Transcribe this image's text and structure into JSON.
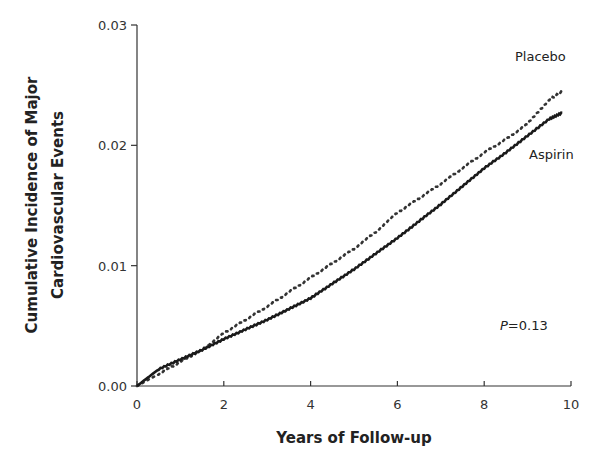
{
  "chart_data": {
    "type": "line",
    "title": "",
    "xlabel": "Years of Follow-up",
    "ylabel_line1": "Cumulative Incidence of Major",
    "ylabel_line2": "Cardiovascular Events",
    "ylabel": "Cumulative Incidence of Major Cardiovascular Events",
    "xlim": [
      0,
      10
    ],
    "ylim": [
      0,
      0.03
    ],
    "x_ticks": [
      "0",
      "2",
      "4",
      "6",
      "8",
      "10"
    ],
    "y_ticks": [
      "0.00",
      "0.01",
      "0.02",
      "0.03"
    ],
    "grid": false,
    "legend_position": "inline labels at line ends (upper right)",
    "annotation": "P=0.13",
    "annotation_p": "P",
    "annotation_value": "=0.13",
    "x": [
      0,
      0.5,
      1,
      1.5,
      2,
      2.5,
      3,
      3.5,
      4,
      4.5,
      5,
      5.5,
      6,
      6.5,
      7,
      7.5,
      8,
      8.5,
      9,
      9.5,
      9.8
    ],
    "series": [
      {
        "name": "Placebo",
        "style": "dotted",
        "values": [
          0,
          0.001,
          0.002,
          0.003,
          0.0044,
          0.0055,
          0.0066,
          0.0078,
          0.009,
          0.0102,
          0.0114,
          0.0128,
          0.0144,
          0.0156,
          0.0168,
          0.0181,
          0.0194,
          0.0205,
          0.0218,
          0.0238,
          0.0245
        ]
      },
      {
        "name": "Aspirin",
        "style": "solid",
        "values": [
          0,
          0.0014,
          0.0022,
          0.003,
          0.0039,
          0.0047,
          0.0055,
          0.0064,
          0.0073,
          0.0085,
          0.0097,
          0.011,
          0.0123,
          0.0137,
          0.0151,
          0.0166,
          0.0181,
          0.0194,
          0.0208,
          0.0222,
          0.0227
        ]
      }
    ]
  }
}
